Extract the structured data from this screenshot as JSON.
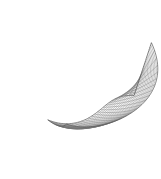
{
  "figure": {
    "title": "",
    "type": "wireframe-surface-plot",
    "background_color": "#ffffff",
    "line_color": "#6e6e6e",
    "edge_color": "#3a3a3a",
    "width_px": 161,
    "height_px": 179,
    "axes_visible": false,
    "labels_visible": false,
    "legend_visible": false
  },
  "chart_data": {
    "type": "line",
    "title": "",
    "xlabel": "",
    "ylabel": "",
    "grid": true,
    "legend_position": "none",
    "surface": {
      "u_lines": 26,
      "v_lines": 22,
      "u_range": [
        0,
        1
      ],
      "v_range": [
        0,
        1
      ],
      "projection": "perspective-3d",
      "shape": "ruled-twisted-sheet"
    },
    "silhouette_points": [
      [
        128,
        3
      ],
      [
        152,
        10
      ],
      [
        141,
        62
      ],
      [
        135,
        96
      ],
      [
        126,
        128
      ],
      [
        118,
        150
      ],
      [
        108,
        166
      ],
      [
        97,
        172
      ],
      [
        88,
        160
      ],
      [
        74,
        138
      ],
      [
        56,
        116
      ],
      [
        38,
        101
      ],
      [
        22,
        92
      ],
      [
        12,
        84
      ],
      [
        16,
        73
      ],
      [
        30,
        62
      ],
      [
        48,
        55
      ],
      [
        70,
        51
      ],
      [
        88,
        48
      ],
      [
        104,
        40
      ],
      [
        118,
        20
      ]
    ],
    "fold_crest": [
      [
        14,
        80
      ],
      [
        28,
        70
      ],
      [
        46,
        62
      ],
      [
        66,
        57
      ],
      [
        86,
        54
      ],
      [
        104,
        45
      ],
      [
        120,
        24
      ],
      [
        128,
        3
      ]
    ],
    "lower_rail": [
      [
        18,
        88
      ],
      [
        34,
        97
      ],
      [
        52,
        110
      ],
      [
        70,
        128
      ],
      [
        84,
        148
      ],
      [
        94,
        164
      ],
      [
        97,
        172
      ]
    ]
  }
}
